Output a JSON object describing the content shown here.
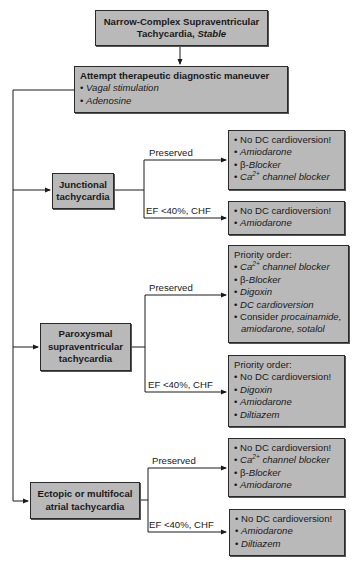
{
  "title": {
    "line1": "Narrow-Complex Supraventricular",
    "line2_prefix": "Tachycardia, ",
    "line2_em": "Stable"
  },
  "maneuver": {
    "heading": "Attempt therapeutic diagnostic maneuver",
    "items": [
      "Vagal stimulation",
      "Adenosine"
    ]
  },
  "branch_labels": {
    "preserved": "Preserved",
    "ef_low": "EF <40%, CHF"
  },
  "bullet": "•",
  "junctional": {
    "label_line1": "Junctional",
    "label_line2": "tachycardia",
    "preserved": [
      "No DC cardioversion!",
      "Amiodarone",
      "β-Blocker",
      "Ca2+ channel blocker"
    ],
    "ef_low": [
      "No DC cardioversion!",
      "Amiodarone"
    ]
  },
  "psvt": {
    "label_line1": "Paroxysmal",
    "label_line2": "supraventricular",
    "label_line3": "tachycardia",
    "preserved_header": "Priority order:",
    "preserved": [
      "Ca2+ channel blocker",
      "β-Blocker",
      "Digoxin",
      "DC cardioversion",
      "Consider procainamide,",
      "amiodarone, sotalol"
    ],
    "ef_low_header": "Priority order:",
    "ef_low": [
      "No DC cardioversion!",
      "Digoxin",
      "Amiodarone",
      "Diltiazem"
    ]
  },
  "ectopic": {
    "label_line1": "Ectopic or multifocal",
    "label_line2": "atrial tachycardia",
    "preserved": [
      "No DC cardioversion!",
      "Ca2+ channel blocker",
      "β-Blocker",
      "Amiodarone"
    ],
    "ef_low": [
      "No DC cardioversion!",
      "Amiodarone",
      "Diltiazem"
    ]
  },
  "colors": {
    "box_fill": "#b9b9b9",
    "line": "#1a1a1a"
  }
}
